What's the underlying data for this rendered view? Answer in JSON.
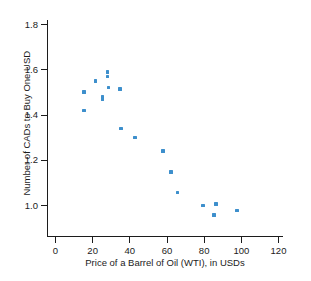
{
  "chart_data": {
    "type": "scatter",
    "title": "",
    "xlabel": "Price of a Barrel of Oil (WTI), in USDs",
    "ylabel": "Number of CADs to Buy One USD",
    "xlim": [
      0,
      120
    ],
    "ylim": [
      0.9,
      1.8
    ],
    "grid": false,
    "legend": null,
    "xticks": [
      0,
      20,
      40,
      60,
      80,
      100,
      120
    ],
    "xtick_labels": [
      "0",
      "20",
      "40",
      "60",
      "80",
      "100",
      "120"
    ],
    "yticks": [
      1.0,
      1.2,
      1.4,
      1.6,
      1.8
    ],
    "ytick_labels": [
      "1.0",
      "1.2",
      "1.4",
      "1.6",
      "1.8"
    ],
    "marker_color": "#3d8fcc",
    "axis_color": "#1c1c1c",
    "points": [
      {
        "x": 15.5,
        "y": 1.5
      },
      {
        "x": 15.5,
        "y": 1.417
      },
      {
        "x": 21.8,
        "y": 1.548
      },
      {
        "x": 25.6,
        "y": 1.478
      },
      {
        "x": 25.6,
        "y": 1.468
      },
      {
        "x": 28.3,
        "y": 1.589
      },
      {
        "x": 28.3,
        "y": 1.568
      },
      {
        "x": 28.8,
        "y": 1.519
      },
      {
        "x": 35.0,
        "y": 1.514
      },
      {
        "x": 35.5,
        "y": 1.338
      },
      {
        "x": 43.0,
        "y": 1.298
      },
      {
        "x": 58.0,
        "y": 1.238
      },
      {
        "x": 62.5,
        "y": 1.147
      },
      {
        "x": 66.0,
        "y": 1.055
      },
      {
        "x": 79.5,
        "y": 0.997
      },
      {
        "x": 86.5,
        "y": 1.005
      },
      {
        "x": 85.5,
        "y": 0.957
      },
      {
        "x": 98.0,
        "y": 0.976
      }
    ]
  }
}
